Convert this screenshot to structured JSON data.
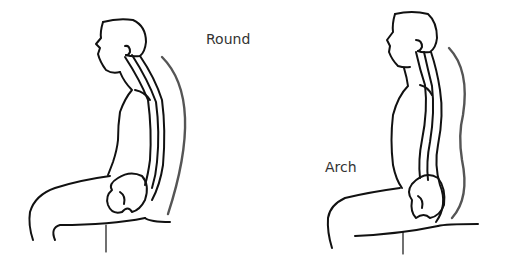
{
  "figure": {
    "figures": [
      {
        "id": "left",
        "label": "Round",
        "description": "Seated figure with rounded (slouched) spine, C-shaped back curve"
      },
      {
        "id": "right",
        "label": "Arch",
        "description": "Seated figure with arched (upright) spine, S-shaped back curve"
      }
    ],
    "colors": {
      "line": "#111111",
      "curve": "#555555",
      "text": "#333333",
      "background": "#ffffff"
    }
  }
}
